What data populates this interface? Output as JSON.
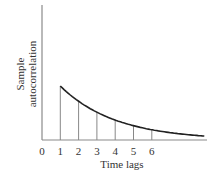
{
  "chart_data": {
    "type": "line",
    "title": "",
    "xlabel": "Time lags",
    "ylabel": "Sample autocorrelation",
    "ylabel_lines": [
      "Sample",
      "autocorrelation"
    ],
    "x_tick_labels": [
      "0",
      "1",
      "2",
      "3",
      "4",
      "5",
      "6"
    ],
    "x": [
      1,
      2,
      3,
      4,
      5,
      6
    ],
    "values": [
      1.0,
      0.72,
      0.52,
      0.37,
      0.26,
      0.19
    ],
    "curve": "smooth exponential decay from lag 1 continuing beyond lag 6",
    "stems": true,
    "grid": false,
    "legend": null,
    "y_ticks_shown": false,
    "colors": {
      "axis": "#888888",
      "curve": "#222222",
      "stem": "#888888",
      "text": "#333333"
    }
  }
}
